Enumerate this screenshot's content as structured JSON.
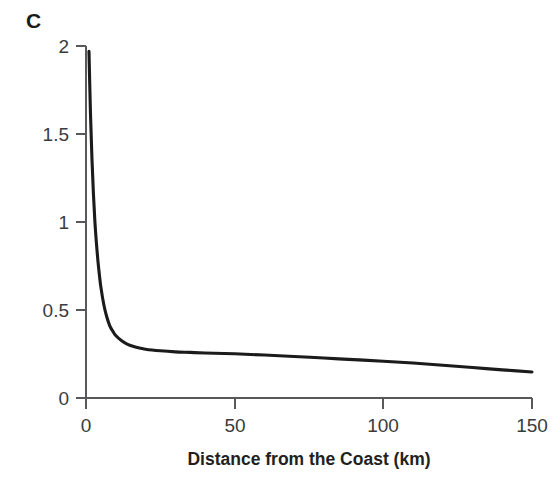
{
  "figure": {
    "panel_label": "C",
    "background_color": "#ffffff"
  },
  "chart_data": {
    "type": "line",
    "title": "",
    "subtitle": "",
    "panel_label": "C",
    "xlabel": "Distance from the Coast (km)",
    "ylabel": "Annual Damage Ratio (%)",
    "xlim": [
      0,
      150
    ],
    "ylim": [
      0,
      2
    ],
    "xticks": [
      0,
      50,
      100,
      150
    ],
    "xticklabels": [
      "0",
      "50",
      "100",
      "150"
    ],
    "yticks": [
      0,
      0.5,
      1,
      1.5,
      2
    ],
    "yticklabels": [
      "0",
      "0.5",
      "1",
      "1.5",
      "2"
    ],
    "grid": false,
    "legend": null,
    "legend_position": "none",
    "series": [
      {
        "name": "Annual Damage Ratio",
        "color": "#1b1b1b",
        "line_width": 3.1,
        "x": [
          1.0,
          1.5,
          2.0,
          2.5,
          3.0,
          3.5,
          4.0,
          4.5,
          5.0,
          6.0,
          7.0,
          8.0,
          9.0,
          10.0,
          12.0,
          14.0,
          16.0,
          18.0,
          20.0,
          25.0,
          30.0,
          35.0,
          40.0,
          50.0,
          60.0,
          70.0,
          80.0,
          90.0,
          100.0,
          110.0,
          120.0,
          130.0,
          140.0,
          150.0
        ],
        "y": [
          1.97,
          1.62,
          1.36,
          1.16,
          1.0,
          0.88,
          0.78,
          0.7,
          0.63,
          0.53,
          0.46,
          0.41,
          0.38,
          0.355,
          0.325,
          0.305,
          0.293,
          0.284,
          0.277,
          0.268,
          0.262,
          0.259,
          0.256,
          0.251,
          0.244,
          0.236,
          0.227,
          0.218,
          0.209,
          0.199,
          0.186,
          0.173,
          0.16,
          0.148
        ]
      }
    ],
    "axis_spine_color": "#58585a",
    "tick_direction": "out"
  }
}
